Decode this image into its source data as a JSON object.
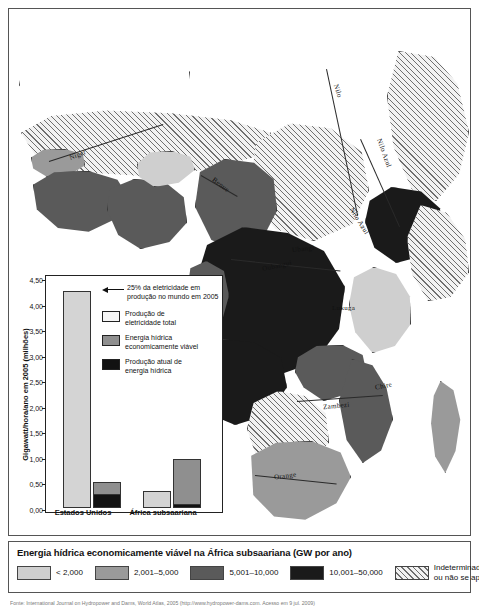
{
  "map": {
    "title": "Mapa da energia hidrica economicamente viavel na Africa subsaariana",
    "river_labels": [
      {
        "name": "Niger",
        "x": 60,
        "y": 142,
        "rot": -22
      },
      {
        "name": "Benue",
        "x": 202,
        "y": 172,
        "rot": 38
      },
      {
        "name": "Nilo",
        "x": 322,
        "y": 78,
        "rot": 72
      },
      {
        "name": "Nilo Azul",
        "x": 360,
        "y": 140,
        "rot": 70
      },
      {
        "name": "Nilo Azul",
        "x": 335,
        "y": 208,
        "rot": 58
      },
      {
        "name": "Ubangi",
        "x": 283,
        "y": 236,
        "rot": -6
      },
      {
        "name": "Oubangui",
        "x": 253,
        "y": 253,
        "rot": -12
      },
      {
        "name": "Lukuga",
        "x": 323,
        "y": 295,
        "rot": 0
      },
      {
        "name": "Zambezi",
        "x": 314,
        "y": 393,
        "rot": -5
      },
      {
        "name": "Chire",
        "x": 366,
        "y": 373,
        "rot": -12
      },
      {
        "name": "Orange",
        "x": 265,
        "y": 463,
        "rot": -8
      }
    ]
  },
  "chart_data": {
    "type": "bar",
    "stacked": true,
    "title": "",
    "xlabel": "",
    "ylabel": "Gigawatt/hora/ano em 2005 (milhões)",
    "ylim": [
      0,
      4.5
    ],
    "yticks": [
      "0,00",
      "0,50",
      "1,00",
      "1,50",
      "2,00",
      "2,50",
      "3,00",
      "3,50",
      "4,00",
      "4,50"
    ],
    "ytick_values": [
      0.0,
      0.5,
      1.0,
      1.5,
      2.0,
      2.5,
      3.0,
      3.5,
      4.0,
      4.5
    ],
    "categories": [
      "Estados Unidos",
      "África subsaariana"
    ],
    "series": [
      {
        "name": "Produção de eletricidade total",
        "values": [
          4.25,
          0.33
        ]
      },
      {
        "name": "Energia hídrica economicamente viável",
        "values": [
          0.5,
          0.95
        ]
      },
      {
        "name": "Produção atual de energia hídrica",
        "values": [
          0.28,
          0.07
        ]
      }
    ],
    "grid": false,
    "legend_position": "inside-top-right",
    "annotation": "25% da eletricidade em produção no mundo em 2005",
    "legend": [
      {
        "label_line1": "Produção de",
        "label_line2": "eletricidade total",
        "swatch": "total"
      },
      {
        "label_line1": "Energia hídrica",
        "label_line2": "economicamente viável",
        "swatch": "viable"
      },
      {
        "label_line1": "Produção atual de",
        "label_line2": "energia hídrica",
        "swatch": "actual"
      }
    ]
  },
  "legend": {
    "title": "Energia hídrica economicamente viável na África subsaariana (GW por ano)",
    "items": [
      {
        "label": "< 2,000",
        "color": "#cfcfcf",
        "kind": "solid"
      },
      {
        "label": "2,001–5,000",
        "color": "#9a9a9a",
        "kind": "solid"
      },
      {
        "label": "5,001–10,000",
        "color": "#5a5a5a",
        "kind": "solid"
      },
      {
        "label": "10,001–50,000",
        "color": "#1a1a1a",
        "kind": "solid"
      }
    ],
    "na_label_line1": "Indeterminado",
    "na_label_line2": "ou não se aplica"
  },
  "source": {
    "text": "Fonte: International Journal on Hydropower and Dams, World Atlas, 2005 (http://www.hydropower-dams.com. Acesso em 9 jul. 2009)"
  }
}
